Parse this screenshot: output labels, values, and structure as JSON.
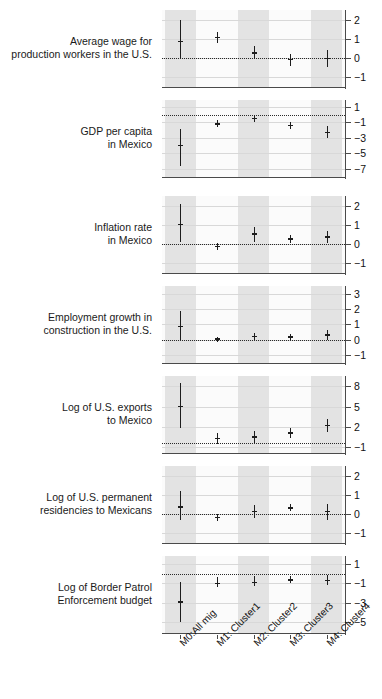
{
  "chart_data": {
    "type": "scatter",
    "title": "",
    "subtitle": "",
    "xlabel": "",
    "ylabel": "",
    "grid": true,
    "legend_position": "none",
    "plot_style": "coefficient-forest-plot-small-multiples",
    "categories": [
      "M0:All mig",
      "M1: Cluster1",
      "M2: Cluster2",
      "M3: Cluster3",
      "M4: Cluster4"
    ],
    "panels": [
      {
        "label": "Average wage for\nproduction workers in the U.S.",
        "ylim": [
          -1.6,
          2.5
        ],
        "yticks": [
          2,
          1,
          0,
          -1
        ],
        "ytick_labels": [
          "2",
          "1",
          "0",
          "-1"
        ],
        "reference_line": 0,
        "estimates": [
          0.85,
          1.05,
          0.25,
          -0.1,
          -0.05
        ],
        "ci_low": [
          0.0,
          0.75,
          -0.05,
          -0.45,
          -0.5
        ],
        "ci_high": [
          1.95,
          1.35,
          0.6,
          0.2,
          0.4
        ]
      },
      {
        "label": "GDP per capita\nin Mexico",
        "ylim": [
          -8.2,
          1.9
        ],
        "yticks": [
          1,
          -1,
          -3,
          -5,
          -7
        ],
        "ytick_labels": [
          "1",
          "-1",
          "-3",
          "-5",
          "-7"
        ],
        "reference_line": 0,
        "estimates": [
          -4.0,
          -1.2,
          -0.5,
          -1.4,
          -2.3
        ],
        "ci_low": [
          -6.6,
          -1.6,
          -0.9,
          -1.8,
          -3.0
        ],
        "ci_high": [
          -1.8,
          -0.7,
          -0.1,
          -0.9,
          -1.5
        ]
      },
      {
        "label": "Inflation rate\nin Mexico",
        "ylim": [
          -1.6,
          2.5
        ],
        "yticks": [
          2,
          1,
          0,
          -1
        ],
        "ytick_labels": [
          "2",
          "1",
          "0",
          "-1"
        ],
        "reference_line": 0,
        "estimates": [
          1.0,
          -0.15,
          0.5,
          0.25,
          0.35
        ],
        "ci_low": [
          0.1,
          -0.35,
          0.1,
          0.05,
          0.05
        ],
        "ci_high": [
          2.1,
          0.05,
          0.85,
          0.45,
          0.65
        ]
      },
      {
        "label": "Employment growth in\nconstruction in the U.S.",
        "ylim": [
          -1.6,
          3.5
        ],
        "yticks": [
          3,
          2,
          1,
          0,
          -1
        ],
        "ytick_labels": [
          "3",
          "2",
          "1",
          "0",
          "-1"
        ],
        "reference_line": 0,
        "estimates": [
          0.85,
          0.02,
          0.2,
          0.18,
          0.3
        ],
        "ci_low": [
          0.0,
          -0.15,
          0.0,
          0.0,
          0.0
        ],
        "ci_high": [
          1.85,
          0.18,
          0.4,
          0.35,
          0.6
        ]
      },
      {
        "label": "Log of U.S. exports\nto Mexico",
        "ylim": [
          -2.0,
          9.5
        ],
        "yticks": [
          8,
          5,
          2,
          -1
        ],
        "ytick_labels": [
          "8",
          "5",
          "2",
          "-1"
        ],
        "reference_line": -0.4,
        "estimates": [
          5.0,
          0.3,
          0.5,
          1.1,
          2.2
        ],
        "ci_low": [
          1.9,
          -0.5,
          -0.4,
          0.3,
          1.2
        ],
        "ci_high": [
          8.4,
          1.1,
          1.4,
          1.8,
          3.1
        ]
      },
      {
        "label": "Log of U.S. permanent\nresidencies to Mexicans",
        "ylim": [
          -1.6,
          2.5
        ],
        "yticks": [
          2,
          1,
          0,
          -1
        ],
        "ytick_labels": [
          "2",
          "1",
          "0",
          "-1"
        ],
        "reference_line": 0,
        "estimates": [
          0.35,
          -0.2,
          0.1,
          0.3,
          0.1
        ],
        "ci_low": [
          -0.35,
          -0.4,
          -0.25,
          0.15,
          -0.35
        ],
        "ci_high": [
          1.2,
          -0.02,
          0.45,
          0.5,
          0.5
        ]
      },
      {
        "label": "Log of Border Patrol\nEnforcement budget",
        "ylim": [
          -6.2,
          1.8
        ],
        "yticks": [
          1,
          -1,
          -3,
          -5
        ],
        "ytick_labels": [
          "1",
          "-1",
          "-3",
          "-5"
        ],
        "reference_line": 0,
        "estimates": [
          -2.9,
          -1.0,
          -0.9,
          -0.65,
          -0.7
        ],
        "ci_low": [
          -5.0,
          -1.4,
          -1.3,
          -1.0,
          -1.2
        ],
        "ci_high": [
          -0.9,
          -0.4,
          -0.3,
          -0.25,
          -0.15
        ]
      }
    ]
  }
}
